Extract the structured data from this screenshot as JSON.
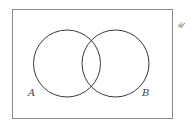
{
  "diagram": {
    "type": "venn",
    "universal_label": "𝒰",
    "sets": [
      {
        "label": "A"
      },
      {
        "label": "B"
      }
    ],
    "colors": {
      "stroke": "#3a3a3a",
      "frame": "#8a8a8a",
      "background": "#ffffff"
    }
  }
}
